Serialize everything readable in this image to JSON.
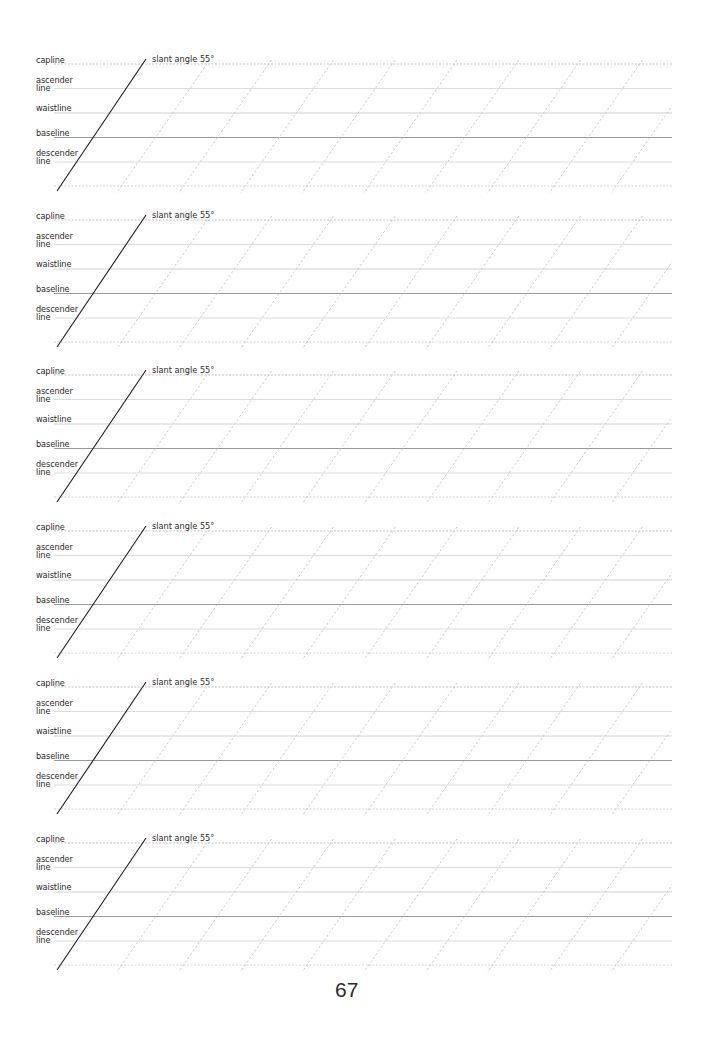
{
  "page": {
    "number": "67",
    "block_count": 6,
    "block_tops": [
      64,
      220,
      375,
      531,
      687,
      843
    ]
  },
  "guide_lines": {
    "capline": "capline",
    "ascender": "ascender\nline",
    "waistline": "waistline",
    "baseline": "baseline",
    "descender": "descender\nline",
    "slant_label": "slant angle 55°"
  },
  "geometry": {
    "line_left": 34,
    "line_right": 672,
    "line_offsets": {
      "capline": 0,
      "ascender": 24.5,
      "waistline": 49,
      "baseline": 73.5,
      "descender": 98,
      "bottom": 122
    },
    "slant_angle_deg": 55,
    "dashed_slant_spacing": 61.8,
    "dashed_slant_first_top_x": 207
  },
  "colors": {
    "capline": "#b4b4b4",
    "ascender": "#d2d2d2",
    "waistline": "#c4c4c4",
    "baseline": "#8f8f8f",
    "descender": "#d2d2d2",
    "bottom": "#c8c8c8",
    "slant_solid": "#1a1a1a",
    "slant_dashed": "#bdbdbd"
  }
}
